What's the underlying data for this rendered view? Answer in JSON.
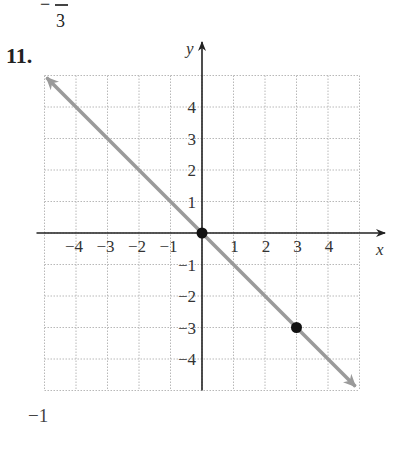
{
  "header": {
    "fraction_sign": "−",
    "fraction_denominator": "3"
  },
  "problem": {
    "number": "11."
  },
  "footer": {
    "text": "−1"
  },
  "chart_data": {
    "type": "line",
    "title": "",
    "xlabel": "x",
    "ylabel": "y",
    "xlim": [
      -5,
      5
    ],
    "ylim": [
      -5,
      5
    ],
    "grid": true,
    "x_ticks": [
      "−4",
      "−3",
      "−2",
      "−1",
      "1",
      "2",
      "3",
      "4"
    ],
    "y_ticks": [
      "4",
      "3",
      "2",
      "1",
      "−1",
      "−2",
      "−3",
      "−4"
    ],
    "series": [
      {
        "name": "y = −x",
        "x": [
          -5,
          5
        ],
        "y": [
          5,
          -5
        ],
        "color": "#9a9a9a",
        "arrows": "both"
      }
    ],
    "points": [
      {
        "x": 0,
        "y": 0,
        "color": "#111111"
      },
      {
        "x": 3,
        "y": -3,
        "color": "#111111"
      }
    ]
  }
}
